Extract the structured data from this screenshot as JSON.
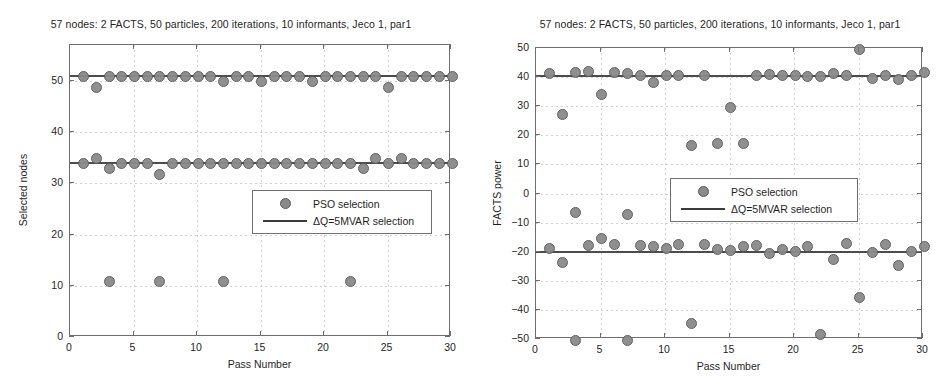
{
  "figure": {
    "width": 949,
    "height": 388,
    "background": "#ffffff",
    "marker_color": "#8a8a8a",
    "line_color": "#4c4c4c"
  },
  "legend_common": {
    "scatter_label": "PSO selection",
    "line_label": "ΔQ=5MVAR selection"
  },
  "chart_data": [
    {
      "id": "selected-nodes",
      "type": "scatter",
      "title": "57 nodes: 2 FACTS, 50 particles, 200 iterations, 10 informants, Jeco 1, par1",
      "xlabel": "Pass Number",
      "ylabel": "Selected nodes",
      "xlim": [
        0,
        30
      ],
      "ylim": [
        0,
        57
      ],
      "xticks": [
        0,
        5,
        10,
        15,
        20,
        25,
        30
      ],
      "yticks": [
        0,
        10,
        20,
        30,
        40,
        50
      ],
      "xticklabels": [
        "0",
        "5",
        "10",
        "15",
        "20",
        "25",
        "30"
      ],
      "yticklabels": [
        "0",
        "10",
        "20",
        "30",
        "40",
        "50"
      ],
      "grid": true,
      "legend_position": "center-right",
      "reference_lines": [
        51,
        34
      ],
      "series": [
        {
          "name": "PSO selection",
          "x": [
            1,
            2,
            3,
            4,
            5,
            6,
            7,
            8,
            9,
            10,
            11,
            12,
            13,
            14,
            15,
            16,
            17,
            18,
            19,
            20,
            21,
            22,
            23,
            24,
            25,
            26,
            27,
            28,
            29,
            30
          ],
          "y": [
            51,
            49,
            51,
            51,
            51,
            51,
            51,
            51,
            51,
            51,
            51,
            50,
            51,
            51,
            50,
            51,
            51,
            51,
            50,
            51,
            51,
            51,
            51,
            51,
            49,
            51,
            51,
            51,
            51,
            51
          ]
        },
        {
          "name": "PSO selection",
          "x": [
            1,
            2,
            3,
            4,
            5,
            6,
            7,
            8,
            9,
            10,
            11,
            12,
            13,
            14,
            15,
            16,
            17,
            18,
            19,
            20,
            21,
            22,
            23,
            24,
            25,
            26,
            27,
            28,
            29,
            30
          ],
          "y": [
            34,
            35,
            33,
            34,
            34,
            34,
            32,
            34,
            34,
            34,
            34,
            34,
            34,
            34,
            34,
            34,
            34,
            34,
            34,
            34,
            34,
            34,
            33,
            35,
            34,
            35,
            34,
            34,
            34,
            34
          ]
        },
        {
          "name": "PSO selection",
          "x": [
            3,
            7,
            12,
            22
          ],
          "y": [
            11,
            11,
            11,
            11
          ]
        }
      ]
    },
    {
      "id": "facts-power",
      "type": "scatter",
      "title": "57 nodes: 2 FACTS, 50 particles, 200 iterations, 10 informants, Jeco 1, par1",
      "xlabel": "Pass Number",
      "ylabel": "FACTS power",
      "xlim": [
        0,
        30
      ],
      "ylim": [
        -50,
        50
      ],
      "xticks": [
        0,
        5,
        10,
        15,
        20,
        25,
        30
      ],
      "yticks": [
        -50,
        -40,
        -30,
        -20,
        -10,
        0,
        10,
        20,
        30,
        40,
        50
      ],
      "xticklabels": [
        "0",
        "5",
        "10",
        "15",
        "20",
        "25",
        "30"
      ],
      "yticklabels": [
        "−50",
        "−40",
        "−30",
        "−20",
        "−10",
        "0",
        "10",
        "20",
        "30",
        "40",
        "50"
      ],
      "grid": true,
      "legend_position": "center-right",
      "reference_lines": [
        40.5,
        -20
      ],
      "series": [
        {
          "name": "PSO selection",
          "x": [
            1,
            2,
            3,
            4,
            5,
            6,
            7,
            8,
            9,
            10,
            11,
            12,
            13,
            14,
            15,
            16,
            17,
            18,
            19,
            20,
            21,
            22,
            23,
            24,
            25,
            26,
            27,
            28,
            29,
            30
          ],
          "y": [
            41.5,
            27.5,
            41.8,
            42.2,
            34.5,
            41.8,
            41.5,
            41,
            38.5,
            41,
            41,
            16.7,
            41,
            17.5,
            30,
            17.5,
            41,
            41.3,
            41,
            41,
            40.7,
            40.5,
            41.5,
            41,
            50,
            40,
            41,
            39.5,
            41,
            42
          ]
        },
        {
          "name": "PSO selection",
          "x": [
            1,
            2,
            3,
            4,
            5,
            6,
            7,
            8,
            9,
            10,
            11,
            12,
            13,
            14,
            15,
            16,
            17,
            18,
            19,
            20,
            21,
            22,
            23,
            24,
            25,
            26,
            27,
            28,
            29,
            30
          ],
          "y": [
            -18.7,
            -23.5,
            -50,
            -17.5,
            -15,
            -17,
            -50,
            -17.5,
            -18,
            -18.5,
            -17.3,
            -44.2,
            -17,
            -19,
            -19.3,
            -18,
            -17.5,
            -20.3,
            -19,
            -19.5,
            -18,
            -48,
            -22.3,
            -16.8,
            -35.5,
            -20,
            -17.3,
            -24.3,
            -19.7,
            -18
          ]
        },
        {
          "name": "PSO selection",
          "x": [
            3,
            7,
            22
          ],
          "y": [
            -6.2,
            -7,
            -6.2
          ]
        }
      ]
    }
  ]
}
